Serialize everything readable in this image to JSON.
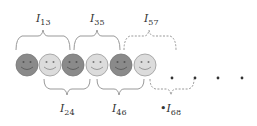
{
  "diagram": {
    "faces": [
      {
        "id": 1,
        "shade": "dark",
        "fill": "#8a8a8a"
      },
      {
        "id": 2,
        "shade": "light",
        "fill": "#dcdcdc"
      },
      {
        "id": 3,
        "shade": "dark",
        "fill": "#8a8a8a"
      },
      {
        "id": 4,
        "shade": "light",
        "fill": "#dcdcdc"
      },
      {
        "id": 5,
        "shade": "dark",
        "fill": "#8a8a8a"
      },
      {
        "id": 6,
        "shade": "light",
        "fill": "#dcdcdc"
      }
    ],
    "intervals_top": [
      {
        "main": "I",
        "sub": "13",
        "style": "solid"
      },
      {
        "main": "I",
        "sub": "35",
        "style": "solid"
      },
      {
        "main": "I",
        "sub": "57",
        "style": "dashed"
      }
    ],
    "intervals_bottom": [
      {
        "main": "I",
        "sub": "24",
        "style": "solid"
      },
      {
        "main": "I",
        "sub": "46",
        "style": "solid"
      },
      {
        "main": "I",
        "sub": "68",
        "style": "dashed",
        "prefix": "•"
      }
    ],
    "ellipsis_dots": 4,
    "colors": {
      "brace": "#999999",
      "dark_face": "#8a8a8a",
      "light_face": "#dcdcdc",
      "dot": "#333333"
    }
  }
}
